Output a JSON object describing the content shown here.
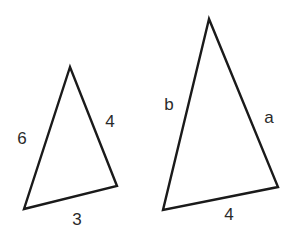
{
  "diagram": {
    "background": "#ffffff",
    "stroke_color": "#1a1a1a",
    "label_color": "#2a2a2a",
    "triangles": [
      {
        "id": "small",
        "points": "70,67 24,209 117,186",
        "labels": {
          "left_side": {
            "text": "6",
            "x": 22,
            "y": 140
          },
          "right_side": {
            "text": "4",
            "x": 110,
            "y": 123
          },
          "bottom_side": {
            "text": "3",
            "x": 77,
            "y": 221
          }
        }
      },
      {
        "id": "large",
        "points": "209,19 163,210 278,187",
        "labels": {
          "left_side": {
            "text": "b",
            "x": 169,
            "y": 106
          },
          "right_side": {
            "text": "a",
            "x": 269,
            "y": 119
          },
          "bottom_side": {
            "text": "4",
            "x": 229,
            "y": 216
          }
        }
      }
    ]
  }
}
